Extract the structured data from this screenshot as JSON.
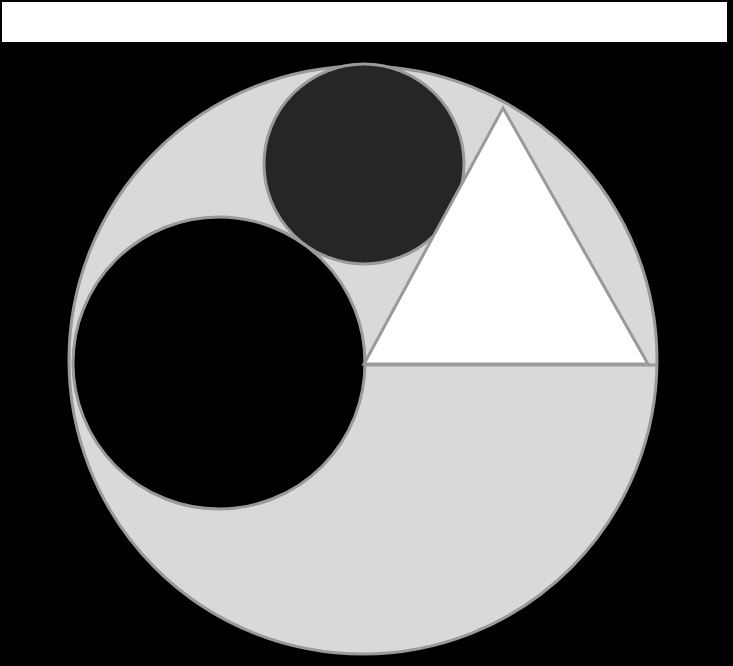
{
  "canvas": {
    "width": 733,
    "height": 666,
    "background_color": "#000000"
  },
  "top_band": {
    "name": "white-banner-strip",
    "color": "#ffffff",
    "x": 2,
    "y": 2,
    "width": 725,
    "height": 40
  },
  "palette": {
    "background": "#000000",
    "banner": "#ffffff",
    "light_gray_fill": "#d9d9d9",
    "dark_charcoal_fill": "#262626",
    "black_fill": "#000000",
    "white_fill": "#ffffff",
    "stroke_gray": "#9a9a9a"
  },
  "shapes": [
    {
      "id": "base-circle",
      "name": "large-light-gray-circle",
      "type": "circle",
      "cx": 363,
      "cy": 360,
      "r": 294,
      "fill": "#d9d9d9",
      "stroke": "#9a9a9a",
      "stroke_width": 3
    },
    {
      "id": "chord-line",
      "name": "horizontal-chord-line",
      "type": "line",
      "x1": 364,
      "y1": 365,
      "x2": 657,
      "y2": 365,
      "stroke": "#9a9a9a",
      "stroke_width": 3
    },
    {
      "id": "top-circle",
      "name": "dark-charcoal-circle",
      "type": "circle",
      "cx": 364,
      "cy": 164,
      "r": 100,
      "fill": "#262626",
      "stroke": "#9a9a9a",
      "stroke_width": 3
    },
    {
      "id": "left-circle",
      "name": "large-black-circle",
      "type": "circle",
      "cx": 219,
      "cy": 363,
      "r": 146,
      "fill": "#000000",
      "stroke": "#9a9a9a",
      "stroke_width": 3
    },
    {
      "id": "triangle",
      "name": "white-triangle",
      "type": "polygon",
      "points": "503,108 648,364 364,364",
      "vertices": [
        {
          "label": "apex",
          "x": 503,
          "y": 108
        },
        {
          "label": "bottom-right",
          "x": 648,
          "y": 364
        },
        {
          "label": "bottom-left",
          "x": 364,
          "y": 364
        }
      ],
      "fill": "#ffffff",
      "stroke": "#9a9a9a",
      "stroke_width": 3
    }
  ]
}
